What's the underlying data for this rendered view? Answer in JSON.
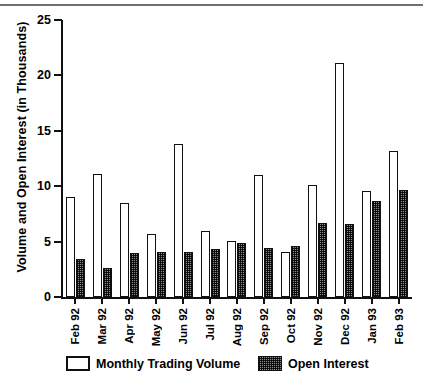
{
  "chart_data": {
    "type": "bar",
    "title": "",
    "subtitle": "",
    "xlabel": "",
    "ylabel": "Volume and Open Interest (in Thousands)",
    "ylim": [
      0,
      25
    ],
    "yticks": [
      0,
      5,
      10,
      15,
      20,
      25
    ],
    "ytick_labels": [
      "0",
      "5",
      "10",
      "15",
      "20",
      "25"
    ],
    "grid": false,
    "legend_position": "bottom",
    "categories": [
      "Feb 92",
      "Mar 92",
      "Apr 92",
      "May 92",
      "Jun 92",
      "Jul 92",
      "Aug 92",
      "Sep 92",
      "Oct 92",
      "Nov 92",
      "Dec 92",
      "Jan 93",
      "Feb 93"
    ],
    "series": [
      {
        "name": "Monthly Trading Volume",
        "style": "open-white",
        "values": [
          9.0,
          11.1,
          8.5,
          5.7,
          13.8,
          6.0,
          5.1,
          11.0,
          4.1,
          10.1,
          21.1,
          9.6,
          13.2
        ]
      },
      {
        "name": "Open Interest",
        "style": "hatched-dark",
        "values": [
          3.4,
          2.6,
          4.0,
          4.1,
          4.1,
          4.3,
          4.9,
          4.4,
          4.6,
          6.7,
          6.6,
          8.7,
          9.7
        ]
      }
    ],
    "legend": [
      {
        "label": "Monthly Trading Volume",
        "swatch": "open-white"
      },
      {
        "label": "Open Interest",
        "swatch": "hatched-dark"
      }
    ]
  },
  "colors": {
    "axis": "#111111",
    "bar_volume_fill": "#ffffff",
    "bar_volume_stroke": "#111111",
    "bar_open_interest_fill": "#8d8d8d",
    "background": "#ffffff",
    "top_rule": "#6f6f6f"
  }
}
